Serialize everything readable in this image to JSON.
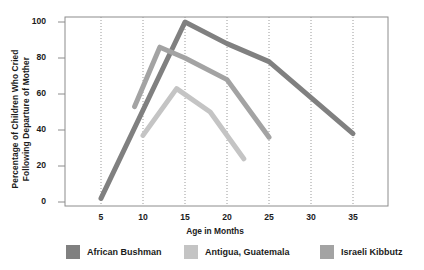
{
  "chart_data": {
    "type": "line",
    "title": "",
    "subtitle": "",
    "xlabel": "Age in Months",
    "ylabel": "Percentage of Children Who Cried Following Departure of Mother",
    "ylabel_line1": "Percentage of Children Who Cried",
    "ylabel_line2": "Following Departure of Mother",
    "xlim": [
      3,
      38
    ],
    "ylim": [
      0,
      105
    ],
    "xticks": [
      5,
      10,
      15,
      20,
      25,
      30,
      35
    ],
    "yticks": [
      0,
      20,
      40,
      60,
      80,
      100
    ],
    "grid": "vertical-dotted",
    "legend_position": "bottom",
    "series": [
      {
        "name": "African Bushman",
        "color": "#808080",
        "x": [
          5,
          15,
          20,
          25,
          35
        ],
        "y": [
          2,
          100,
          88,
          78,
          38
        ]
      },
      {
        "name": "Antigua, Guatemala",
        "color": "#c4c4c4",
        "x": [
          10,
          14,
          18,
          22
        ],
        "y": [
          37,
          63,
          50,
          24
        ]
      },
      {
        "name": "Israeli Kibbutz",
        "color": "#a3a3a3",
        "x": [
          9,
          12,
          15,
          20,
          25
        ],
        "y": [
          53,
          86,
          80,
          68,
          36
        ]
      }
    ]
  },
  "axis": {
    "y_tick_labels": [
      "100",
      "80",
      "60",
      "40",
      "20",
      "0"
    ],
    "x_tick_labels": [
      "5",
      "10",
      "15",
      "20",
      "25",
      "30",
      "35"
    ],
    "x_title": "Age in Months",
    "y_title_line1": "Percentage of Children Who Cried",
    "y_title_line2": "Following Departure of Mother"
  },
  "legend": {
    "items": [
      {
        "label": "African Bushman",
        "color": "#808080"
      },
      {
        "label": "Antigua, Guatemala",
        "color": "#c4c4c4"
      },
      {
        "label": "Israeli Kibbutz",
        "color": "#a3a3a3"
      }
    ]
  },
  "colors": {
    "african_bushman": "#808080",
    "antigua_guatemala": "#c4c4c4",
    "israeli_kibbutz": "#a3a3a3",
    "axis": "#8c8c8c",
    "grid": "#9a9a9a",
    "text": "#1b1b1b",
    "background": "#ffffff"
  }
}
